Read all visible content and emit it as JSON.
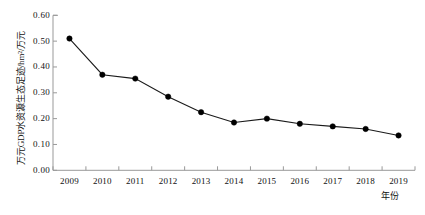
{
  "chart_data": {
    "type": "line",
    "title": "",
    "xlabel": "年份",
    "ylabel": "万元GDP水资源生态足迹/hm²/万元",
    "categories": [
      "2009",
      "2010",
      "2011",
      "2012",
      "2013",
      "2014",
      "2015",
      "2016",
      "2017",
      "2018",
      "2019"
    ],
    "values": [
      0.51,
      0.37,
      0.355,
      0.285,
      0.225,
      0.185,
      0.2,
      0.18,
      0.17,
      0.16,
      0.135
    ],
    "series": [
      {
        "name": "万元GDP水资源生态足迹",
        "values": [
          0.51,
          0.37,
          0.355,
          0.285,
          0.225,
          0.185,
          0.2,
          0.18,
          0.17,
          0.16,
          0.135
        ]
      }
    ],
    "ylim": [
      0.0,
      0.6
    ],
    "ytick_labels": [
      "0.00",
      "0.10",
      "0.20",
      "0.30",
      "0.40",
      "0.50",
      "0.60"
    ],
    "ytick_values": [
      0.0,
      0.1,
      0.2,
      0.3,
      0.4,
      0.5,
      0.6
    ],
    "xlim_categories": [
      "2009",
      "2019"
    ],
    "grid": false,
    "legend": "none",
    "marker": "filled-circle",
    "line_color": "#1a1a1a",
    "marker_color": "#000000",
    "axis_color": "#999999"
  }
}
